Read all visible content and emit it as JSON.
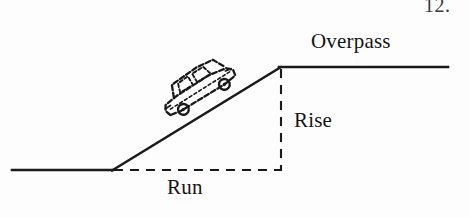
{
  "figure": {
    "number": "12.",
    "background_color": "#fdfdfd",
    "ink_color": "#1a1a1a",
    "labels": {
      "overpass": "Overpass",
      "rise": "Rise",
      "run": "Run"
    },
    "icons": {
      "car": "car-icon"
    },
    "geometry": {
      "ground_line": {
        "x1": 12,
        "y1": 170,
        "x2": 112,
        "y2": 170
      },
      "ramp_line": {
        "x1": 112,
        "y1": 170,
        "x2": 281,
        "y2": 67
      },
      "overpass_line": {
        "x1": 281,
        "y1": 67,
        "x2": 448,
        "y2": 67
      },
      "rise_dashed_line": {
        "x1": 281,
        "y1": 70,
        "x2": 281,
        "y2": 170
      },
      "run_dashed_line": {
        "x1": 114,
        "y1": 170,
        "x2": 281,
        "y2": 170
      }
    }
  }
}
